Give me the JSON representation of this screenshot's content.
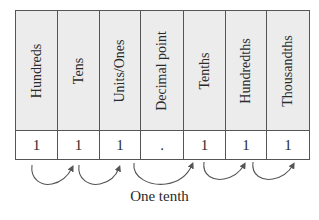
{
  "diagram": {
    "type": "place-value-chart",
    "columns": [
      {
        "header": "Hundreds",
        "value": "1"
      },
      {
        "header": "Tens",
        "value": "1"
      },
      {
        "header": "Units/Ones",
        "value": "1"
      },
      {
        "header": "Decimal point",
        "value": "."
      },
      {
        "header": "Tenths",
        "value": "1"
      },
      {
        "header": "Hundredths",
        "value": "1"
      },
      {
        "header": "Thousandths",
        "value": "1"
      }
    ],
    "arrows": [
      {
        "from": "Hundreds",
        "to": "Tens"
      },
      {
        "from": "Tens",
        "to": "Units/Ones"
      },
      {
        "from": "Units/Ones",
        "to": "Tenths"
      },
      {
        "from": "Tenths",
        "to": "Hundredths"
      },
      {
        "from": "Hundredths",
        "to": "Thousandths"
      }
    ],
    "caption": "One tenth",
    "colors": {
      "header_bg": "#ececec",
      "border": "#555555",
      "arrow": "#555555",
      "text": "#2a2a2a"
    }
  }
}
